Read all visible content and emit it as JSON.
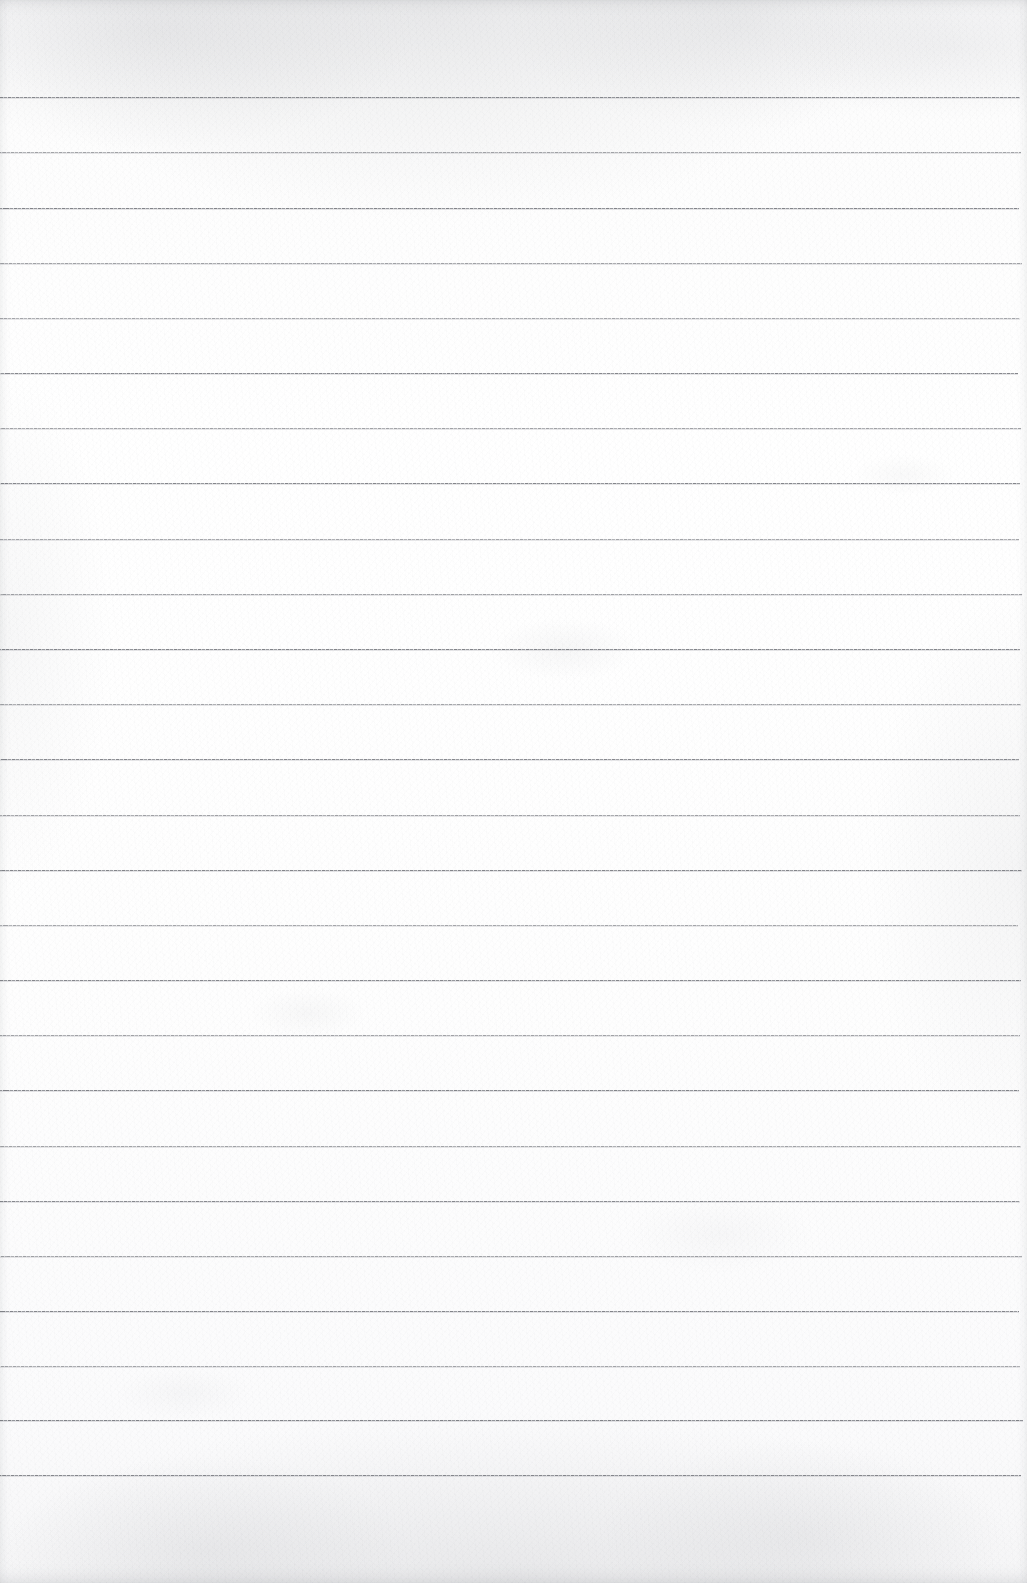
{
  "document": {
    "kind": "scanned-lined-notebook-paper",
    "title": "Blank ruled notebook page",
    "content_text": "",
    "has_handwriting": false,
    "orientation": "portrait"
  },
  "page": {
    "width_px": 1027,
    "height_px": 1583,
    "paper_color": "#fdfdfd",
    "paper_tint_top": "#f7f7f8",
    "paper_tint_bottom": "#f6f6f7",
    "edge_shadow_color": "#787a82"
  },
  "ruling": {
    "style": "wide-ruled-horizontal",
    "line_color": "#74767c",
    "line_color_light": "#a5a7ac",
    "line_thickness_px": 1,
    "line_spacing_px": 55.2,
    "first_line_y_px": 97,
    "left_margin_px": 0,
    "right_margin_px": 7,
    "line_count": 26,
    "vertical_margin_rule": false,
    "holes": false,
    "line_y_positions": [
      97,
      152,
      208,
      263,
      318,
      373,
      428,
      483,
      539,
      594,
      649,
      704,
      759,
      815,
      870,
      925,
      980,
      1035,
      1090,
      1146,
      1201,
      1256,
      1311,
      1366,
      1420,
      1475
    ],
    "line_opacities": [
      0.92,
      0.88,
      0.95,
      0.9,
      0.86,
      0.93,
      0.89,
      0.94,
      0.87,
      0.91,
      0.95,
      0.88,
      0.92,
      0.9,
      0.94,
      0.86,
      0.93,
      0.89,
      0.95,
      0.88,
      0.92,
      0.91,
      0.94,
      0.87,
      0.96,
      0.93
    ],
    "line_right_end_px": [
      1020,
      1021,
      1019,
      1022,
      1020,
      1018,
      1021,
      1020,
      1019,
      1022,
      1020,
      1021,
      1019,
      1020,
      1022,
      1018,
      1021,
      1020,
      1019,
      1021,
      1020,
      1022,
      1019,
      1020,
      1023,
      1021
    ]
  },
  "texture": {
    "grain_opacity": 0.55,
    "top_smudge": true,
    "bottom_smudge": true,
    "vignette": true
  }
}
